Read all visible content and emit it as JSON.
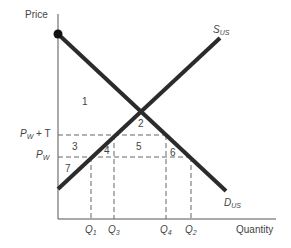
{
  "diagram": {
    "axes": {
      "y_label": "Price",
      "x_label": "Quantity"
    },
    "curves": {
      "supply": {
        "label": "S",
        "subscript": "US",
        "color": "#2b2b2b"
      },
      "demand": {
        "label": "D",
        "subscript": "US",
        "color": "#2b2b2b"
      }
    },
    "price_levels": [
      {
        "label": "P",
        "subscript": "W",
        "suffix": " + T"
      },
      {
        "label": "P",
        "subscript": "W",
        "suffix": ""
      }
    ],
    "quantities": [
      {
        "label": "Q",
        "subscript": "1"
      },
      {
        "label": "Q",
        "subscript": "3"
      },
      {
        "label": "Q",
        "subscript": "4"
      },
      {
        "label": "Q",
        "subscript": "2"
      }
    ],
    "areas": [
      "1",
      "2",
      "3",
      "4",
      "5",
      "6",
      "7"
    ]
  }
}
